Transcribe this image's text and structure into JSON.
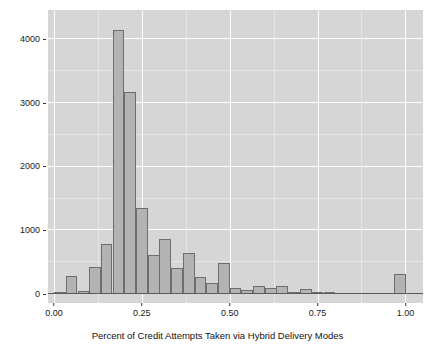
{
  "chart_data": {
    "type": "bar",
    "title": "",
    "subtitle": "",
    "xlabel": "Percent of Credit Attempts Taken via Hybrid Delivery Modes",
    "ylabel": "",
    "xlim": [
      -0.017,
      1.05
    ],
    "ylim": [
      0,
      4400
    ],
    "grid": true,
    "legend": false,
    "bin_width": 0.0333,
    "x_ticks": [
      0.0,
      0.25,
      0.5,
      0.75,
      1.0
    ],
    "x_tick_labels": [
      "0.00",
      "0.25",
      "0.50",
      "0.75",
      "1.00"
    ],
    "y_ticks": [
      0,
      1000,
      2000,
      3000,
      4000
    ],
    "y_tick_labels": [
      "0",
      "1000",
      "2000",
      "3000",
      "4000"
    ],
    "bin_starts": [
      0.0,
      0.033,
      0.067,
      0.1,
      0.133,
      0.167,
      0.2,
      0.233,
      0.267,
      0.3,
      0.333,
      0.367,
      0.4,
      0.433,
      0.467,
      0.5,
      0.533,
      0.567,
      0.6,
      0.633,
      0.667,
      0.7,
      0.733,
      0.767,
      0.8,
      0.833,
      0.867,
      0.9,
      0.933,
      0.967
    ],
    "categories": [
      "0.00",
      "0.03",
      "0.07",
      "0.10",
      "0.13",
      "0.17",
      "0.20",
      "0.23",
      "0.27",
      "0.30",
      "0.33",
      "0.37",
      "0.40",
      "0.43",
      "0.47",
      "0.50",
      "0.53",
      "0.57",
      "0.60",
      "0.63",
      "0.67",
      "0.70",
      "0.73",
      "0.77",
      "0.80",
      "0.83",
      "0.87",
      "0.90",
      "0.93",
      "0.97"
    ],
    "values": [
      10,
      290,
      50,
      430,
      790,
      4150,
      3180,
      1350,
      620,
      860,
      410,
      640,
      270,
      180,
      490,
      90,
      70,
      120,
      100,
      120,
      5,
      80,
      20,
      5,
      0,
      0,
      0,
      0,
      0,
      310
    ],
    "colors": {
      "bar_fill": "#b3b3b3",
      "bar_border": "#6e6e6e",
      "panel_background": "#d6d6d6",
      "gridline_major": "#ffffff",
      "gridline_minor": "#e6e6e6",
      "axis_text": "#1a1a1a",
      "figure_background": "#ffffff"
    }
  }
}
